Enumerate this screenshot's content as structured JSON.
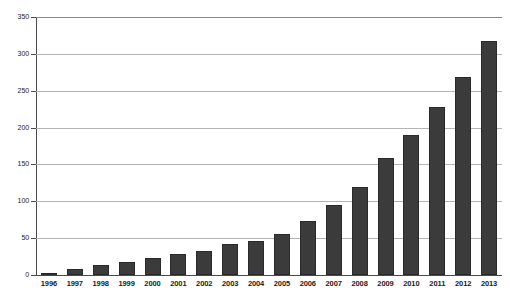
{
  "chart_data": {
    "type": "bar",
    "title": "",
    "subtitle": "",
    "xlabel": "",
    "ylabel": "",
    "categories": [
      "1996",
      "1997",
      "1998",
      "1999",
      "2000",
      "2001",
      "2002",
      "2003",
      "2004",
      "2005",
      "2006",
      "2007",
      "2008",
      "2009",
      "2010",
      "2011",
      "2012",
      "2013"
    ],
    "values": [
      2,
      8,
      13,
      18,
      23,
      28,
      32,
      42,
      46,
      56,
      73,
      95,
      120,
      159,
      190,
      228,
      268,
      318
    ],
    "series": [
      {
        "name": "series-1",
        "values": [
          2,
          8,
          13,
          18,
          23,
          28,
          32,
          42,
          46,
          56,
          73,
          95,
          120,
          159,
          190,
          228,
          268,
          318
        ],
        "color": "#3b3b3b"
      }
    ],
    "ylim": [
      0,
      350
    ],
    "yticks": [
      0,
      50,
      100,
      150,
      200,
      250,
      300,
      350
    ],
    "ytick_labels": [
      "0",
      "50",
      "100",
      "150",
      "200",
      "250",
      "300",
      "350"
    ],
    "grid": true,
    "grid_color": "#b4b4b4",
    "legend": "none",
    "bar_color": "#3b3b3b",
    "background": "#ffffff",
    "axis_color": "#4a4a4a",
    "annotations": []
  }
}
